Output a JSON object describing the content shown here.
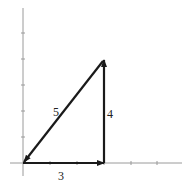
{
  "diagram": {
    "type": "vector-triangle",
    "colors": {
      "axis": "#9a9a9a",
      "vector": "#1a1a1a",
      "label": "#222222"
    },
    "axes": {
      "origin_px": [
        23,
        163
      ],
      "unit_px": [
        27,
        26
      ],
      "x_ticks": [
        1,
        2,
        3,
        4,
        5
      ],
      "y_ticks": [
        1,
        2,
        3,
        4,
        5
      ]
    },
    "vectors": [
      {
        "name": "horizontal",
        "from": [
          0,
          0
        ],
        "to": [
          3,
          0
        ],
        "label": "3"
      },
      {
        "name": "vertical",
        "from": [
          3,
          0
        ],
        "to": [
          3,
          4
        ],
        "label": "4"
      },
      {
        "name": "hypotenuse",
        "from": [
          3,
          4
        ],
        "to": [
          0,
          0
        ],
        "label": "5"
      }
    ],
    "labels": {
      "horizontal": "3",
      "vertical": "4",
      "hypotenuse": "5"
    }
  }
}
